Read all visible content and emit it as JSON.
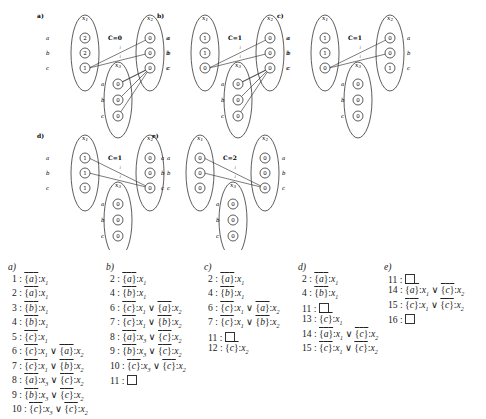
{
  "panels": [
    {
      "label": "a)",
      "C": "C=0",
      "ox": 55,
      "oy": 5,
      "x1": [
        "2",
        "2",
        "1"
      ],
      "x2": [
        "0",
        "0",
        "0"
      ],
      "x3": [
        "0",
        "0",
        "0"
      ],
      "edges": [
        [
          "x1",
          2,
          "x2",
          0
        ],
        [
          "x1",
          2,
          "x2",
          1
        ],
        [
          "x3",
          0,
          "x2",
          2
        ],
        [
          "x3",
          1,
          "x2",
          2
        ],
        [
          "x3",
          2,
          "x2",
          2
        ],
        [
          "x3",
          0,
          "x2",
          2
        ]
      ]
    },
    {
      "label": "b)",
      "C": "C=1",
      "ox": 175,
      "oy": 5,
      "x1": [
        "1",
        "1",
        "0"
      ],
      "x2": [
        "0",
        "0",
        "0"
      ],
      "x3": [
        "0",
        "0",
        "0"
      ],
      "edges": [
        [
          "x1",
          2,
          "x2",
          0
        ],
        [
          "x1",
          2,
          "x2",
          1
        ],
        [
          "x3",
          0,
          "x2",
          2
        ],
        [
          "x3",
          1,
          "x2",
          2
        ],
        [
          "x3",
          2,
          "x2",
          2
        ],
        [
          "x3",
          0,
          "x2",
          2
        ]
      ]
    },
    {
      "label": "c)",
      "C": "C=1",
      "ox": 295,
      "oy": 5,
      "x1": [
        "1",
        "1",
        "0"
      ],
      "x2": [
        "0",
        "0",
        "1"
      ],
      "x3": [
        "0",
        "0",
        "0"
      ],
      "edges": [
        [
          "x1",
          2,
          "x2",
          0
        ],
        [
          "x1",
          2,
          "x2",
          1
        ]
      ]
    },
    {
      "label": "d)",
      "C": "C=1",
      "ox": 55,
      "oy": 125,
      "x1": [
        "1",
        "1",
        "1"
      ],
      "x2": [
        "0",
        "0",
        "0"
      ],
      "x3": [
        "0",
        "0",
        "0"
      ],
      "edges": [
        [
          "x1",
          0,
          "x2",
          2
        ],
        [
          "x1",
          1,
          "x2",
          2
        ]
      ]
    },
    {
      "label": "e)",
      "C": "C=2",
      "ox": 170,
      "oy": 125,
      "x1": [
        "0",
        "0",
        "0"
      ],
      "x2": [
        "0",
        "0",
        "0"
      ],
      "x3": [
        "0",
        "0",
        "0"
      ],
      "edges": [
        [
          "x1",
          0,
          "x2",
          2
        ],
        [
          "x1",
          1,
          "x2",
          2
        ]
      ]
    }
  ],
  "var_names": {
    "x1": "x1",
    "x2": "x2",
    "x3": "x3"
  },
  "row_labels": [
    "a",
    "b",
    "c"
  ],
  "edge_label": "i",
  "columns": [
    {
      "label": "a)",
      "x": 8,
      "rows": [
        "1 : {a}:x1",
        "2 : {a}:x1",
        "3 : {b}:x1",
        "4 : {b}:x1",
        "5 : {c}:x1",
        "6 : {c}:x1 ∨ {a}:x2",
        "7 : {c}:x1 ∨ {b}:x2",
        "8 : {a}:x3 ∨ {c}:x2",
        "9 : {b}:x3 ∨ {c}:x2",
        "10 : {c}:x3 ∨ {c}:x2"
      ]
    },
    {
      "label": "b)",
      "x": 106,
      "rows": [
        "2 : {a}:x1",
        "4 : {b}:x1",
        "6 : {c}:x1 ∨ {a}:x2",
        "7 : {c}:x1 ∨ {b}:x2",
        "8 : {a}:x3 ∨ {c}:x2",
        "9 : {b}:x3 ∨ {c}:x2",
        "10 : {c}:x3 ∨ {c}:x2",
        "11 : □"
      ]
    },
    {
      "label": "c)",
      "x": 204,
      "rows": [
        "2 : {a}:x1",
        "4 : {b}:x1",
        "6 : {c}:x1 ∨ {a}:x2",
        "7 : {c}:x1 ∨ {b}:x2",
        "11 : □",
        "12 : {c}:x2"
      ]
    },
    {
      "label": "d)",
      "x": 298,
      "rows": [
        "2 : {a}:x1",
        "4 : {b}:x1",
        "11 : □",
        "13 : {c}:x1",
        "14 : {a}:x1 ∨ {c}:x2",
        "15 : {c}:x1 ∨ {c}:x2"
      ]
    },
    {
      "label": "e)",
      "x": 384,
      "rows": [
        "11 : □",
        "14 : {a}:x1 ∨ {c}:x2",
        "15 : {c}:x1 ∨ {c}:x2",
        "16 : □"
      ]
    }
  ]
}
